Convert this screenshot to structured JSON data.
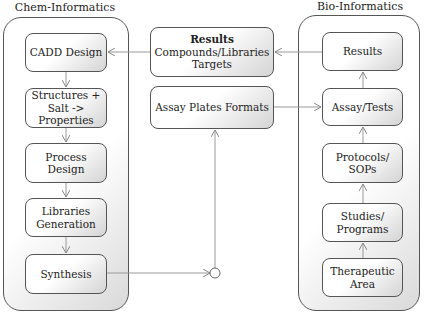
{
  "left_group": {
    "title": "Chem-Informatics",
    "boxes": [
      {
        "lines": [
          "CADD Design"
        ]
      },
      {
        "lines": [
          "Structures +",
          "Salt ->",
          "Properties"
        ]
      },
      {
        "lines": [
          "Process",
          "Design"
        ]
      },
      {
        "lines": [
          "Libraries",
          "Generation"
        ]
      },
      {
        "lines": [
          "Synthesis"
        ]
      }
    ]
  },
  "center": {
    "results": {
      "heading": "Results",
      "lines": [
        "Compounds/Libraries",
        "Targets"
      ]
    },
    "assay_plates": {
      "lines": [
        "Assay Plates Formats"
      ]
    }
  },
  "right_group": {
    "title": "Bio-Informatics",
    "boxes": [
      {
        "lines": [
          "Results"
        ]
      },
      {
        "lines": [
          "Assay/Tests"
        ]
      },
      {
        "lines": [
          "Protocols/",
          "SOPs"
        ]
      },
      {
        "lines": [
          "Studies/",
          "Programs"
        ]
      },
      {
        "lines": [
          "Therapeutic",
          "Area"
        ]
      }
    ]
  },
  "colors": {
    "stroke": "#555555",
    "arrow": "#888888"
  }
}
